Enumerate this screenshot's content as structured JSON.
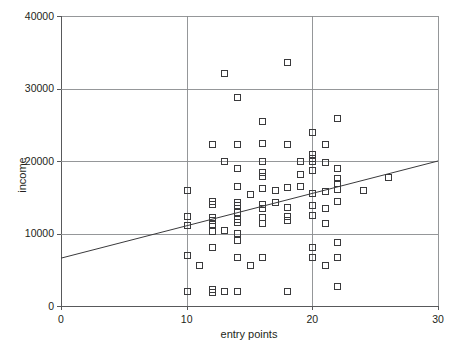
{
  "chart_data": {
    "type": "scatter",
    "title": "",
    "subtitle": "",
    "xlabel": "entry points",
    "ylabel": "income",
    "xlim": [
      0,
      30
    ],
    "ylim": [
      0,
      40000
    ],
    "xticks": [
      0,
      10,
      20,
      30
    ],
    "xtick_labels": [
      "0",
      "10",
      "20",
      "30"
    ],
    "yticks": [
      0,
      10000,
      20000,
      30000,
      40000
    ],
    "ytick_labels": [
      "0",
      "10000",
      "20000",
      "30000",
      "40000"
    ],
    "grid": "horizontal gridlines at 10000/20000/30000 and vertical gridlines at x=10 and x=20",
    "grid_on": true,
    "legend": null,
    "legend_position": "none",
    "marker_style": "open square",
    "marker_color": "#3a3a3c",
    "annotations": [],
    "trend_line": {
      "type": "linear-regression",
      "x_start": 0,
      "y_start": 6600,
      "x_end": 30,
      "y_end": 20000,
      "slope_per_point": 447,
      "intercept": 6600,
      "color": "#3a3a3c"
    },
    "points": [
      [
        10,
        16000
      ],
      [
        10,
        12400
      ],
      [
        10,
        11200
      ],
      [
        10,
        7000
      ],
      [
        10,
        2100
      ],
      [
        11,
        5600
      ],
      [
        12,
        22300
      ],
      [
        12,
        14500
      ],
      [
        12,
        14100
      ],
      [
        12,
        12300
      ],
      [
        12,
        11800
      ],
      [
        12,
        11300
      ],
      [
        12,
        10400
      ],
      [
        12,
        8200
      ],
      [
        12,
        2400
      ],
      [
        12,
        2000
      ],
      [
        13,
        32200
      ],
      [
        13,
        20000
      ],
      [
        13,
        10500
      ],
      [
        13,
        2100
      ],
      [
        14,
        28800
      ],
      [
        14,
        22300
      ],
      [
        14,
        19000
      ],
      [
        14,
        16600
      ],
      [
        14,
        14300
      ],
      [
        14,
        13900
      ],
      [
        14,
        13000
      ],
      [
        14,
        12000
      ],
      [
        14,
        11600
      ],
      [
        14,
        10100
      ],
      [
        14,
        9100
      ],
      [
        14,
        6700
      ],
      [
        14,
        2100
      ],
      [
        15,
        15400
      ],
      [
        15,
        5600
      ],
      [
        16,
        25500
      ],
      [
        16,
        22500
      ],
      [
        16,
        20000
      ],
      [
        16,
        18500
      ],
      [
        16,
        18000
      ],
      [
        16,
        16300
      ],
      [
        16,
        14100
      ],
      [
        16,
        13500
      ],
      [
        16,
        12300
      ],
      [
        16,
        11400
      ],
      [
        16,
        6700
      ],
      [
        17,
        16000
      ],
      [
        17,
        14300
      ],
      [
        18,
        33700
      ],
      [
        18,
        22300
      ],
      [
        18,
        16400
      ],
      [
        18,
        13700
      ],
      [
        18,
        12400
      ],
      [
        18,
        11900
      ],
      [
        18,
        2100
      ],
      [
        19,
        20000
      ],
      [
        19,
        18200
      ],
      [
        19,
        16500
      ],
      [
        20,
        24000
      ],
      [
        20,
        20900
      ],
      [
        20,
        20400
      ],
      [
        20,
        20000
      ],
      [
        20,
        18700
      ],
      [
        20,
        15600
      ],
      [
        20,
        14000
      ],
      [
        20,
        12600
      ],
      [
        20,
        8200
      ],
      [
        20,
        6700
      ],
      [
        21,
        22300
      ],
      [
        21,
        19800
      ],
      [
        21,
        15800
      ],
      [
        21,
        13500
      ],
      [
        21,
        11400
      ],
      [
        21,
        5600
      ],
      [
        22,
        26000
      ],
      [
        22,
        19100
      ],
      [
        22,
        17600
      ],
      [
        22,
        17000
      ],
      [
        22,
        16200
      ],
      [
        22,
        14500
      ],
      [
        22,
        8800
      ],
      [
        22,
        6700
      ],
      [
        22,
        2700
      ],
      [
        24,
        16000
      ],
      [
        26,
        17800
      ]
    ],
    "n_points": 86,
    "geometry": {
      "plot_left_px": 61,
      "plot_right_px": 438,
      "plot_top_px": 16,
      "plot_bottom_px": 306
    }
  },
  "axes": {
    "y_title": "income",
    "x_title": "entry points"
  }
}
